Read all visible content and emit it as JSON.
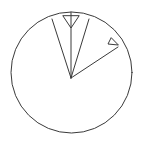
{
  "figure": {
    "kind": "geometry-diagram",
    "canvas": {
      "width": 144,
      "height": 141
    },
    "colors": {
      "background": "#ffffff",
      "stroke": "#3a3a3a"
    },
    "circle": {
      "name": "outer-circle",
      "cx": 71.5,
      "cy": 72.5,
      "r": 60.5
    },
    "vertex": {
      "name": "ray-vertex",
      "x": 71,
      "y": 78
    },
    "rays": [
      {
        "name": "ray-up-left",
        "x1": 71,
        "y1": 78,
        "x2": 52,
        "y2": 19
      },
      {
        "name": "ray-vertical-up",
        "x1": 71,
        "y1": 78,
        "x2": 71,
        "y2": 12
      },
      {
        "name": "ray-up-right",
        "x1": 71,
        "y1": 78,
        "x2": 89,
        "y2": 19
      },
      {
        "name": "ray-diagonal-right",
        "x1": 71,
        "y1": 78,
        "x2": 118,
        "y2": 47
      }
    ],
    "angle_marks": [
      {
        "name": "angle-mark-top",
        "shape": "triangle",
        "points": "63,16 71,28 79,16"
      },
      {
        "name": "angle-mark-right",
        "shape": "triangle",
        "points": "111,38 108,44 118,45"
      }
    ]
  }
}
